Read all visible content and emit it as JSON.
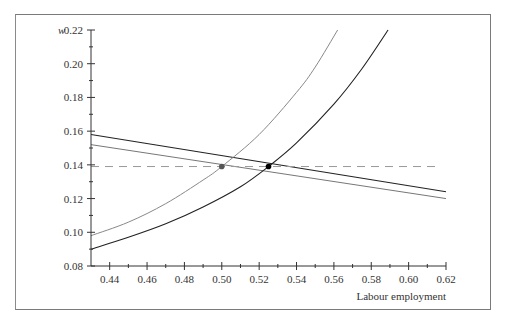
{
  "chart_data": {
    "type": "line",
    "title": "",
    "xlabel": "Labour employment",
    "ylabel": "w",
    "xlim": [
      0.43,
      0.62
    ],
    "ylim": [
      0.08,
      0.22
    ],
    "grid": false,
    "legend": null,
    "x_ticks": [
      "0.44",
      "0.46",
      "0.48",
      "0.50",
      "0.52",
      "0.54",
      "0.56",
      "0.58",
      "0.60",
      "0.62"
    ],
    "y_ticks": [
      "0.08",
      "0.10",
      "0.12",
      "0.14",
      "0.16",
      "0.18",
      "0.20",
      "0.22"
    ],
    "series": [
      {
        "name": "Labour demand (black)",
        "color": "#222222",
        "x": [
          0.43,
          0.62
        ],
        "y": [
          0.158,
          0.124
        ]
      },
      {
        "name": "Labour demand (grey)",
        "color": "#777777",
        "x": [
          0.43,
          0.62
        ],
        "y": [
          0.152,
          0.12
        ]
      },
      {
        "name": "Wage-setting curve (grey)",
        "color": "#888888",
        "x": [
          0.43,
          0.45,
          0.47,
          0.49,
          0.5,
          0.52,
          0.54,
          0.55,
          0.562
        ],
        "y": [
          0.098,
          0.106,
          0.117,
          0.131,
          0.139,
          0.158,
          0.183,
          0.198,
          0.22
        ]
      },
      {
        "name": "Wage-setting curve (black)",
        "color": "#222222",
        "x": [
          0.43,
          0.45,
          0.47,
          0.49,
          0.51,
          0.525,
          0.54,
          0.56,
          0.575,
          0.589
        ],
        "y": [
          0.09,
          0.097,
          0.105,
          0.115,
          0.127,
          0.139,
          0.153,
          0.176,
          0.197,
          0.22
        ]
      },
      {
        "name": "Reference wage (dashed)",
        "color": "#999999",
        "dashed": true,
        "x": [
          0.43,
          0.617
        ],
        "y": [
          0.139,
          0.139
        ]
      }
    ],
    "annotations": [
      {
        "type": "point",
        "x": 0.5,
        "y": 0.139,
        "color": "#555555"
      },
      {
        "type": "point",
        "x": 0.525,
        "y": 0.139,
        "color": "#000000"
      }
    ]
  }
}
